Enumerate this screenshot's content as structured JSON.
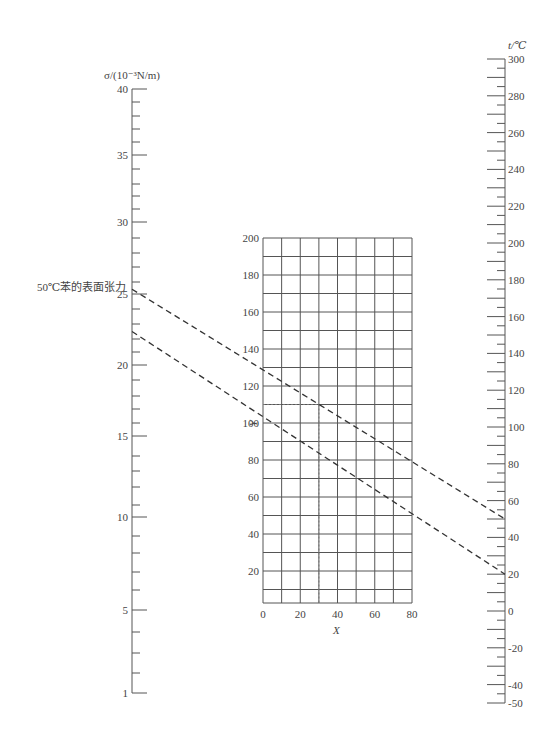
{
  "chart_data": {
    "type": "nomograph",
    "title": "50℃苯的表面张力",
    "annotation": "50℃苯的表面张力",
    "left_axis": {
      "label": "σ/(10⁻³N/m)",
      "major_ticks": [
        40,
        35,
        30,
        25,
        20,
        15,
        10,
        5,
        1
      ],
      "ticks": [
        {
          "v": 40,
          "y": 89
        },
        {
          "v": 39,
          "y": 102
        },
        {
          "v": 38,
          "y": 116
        },
        {
          "v": 37,
          "y": 129
        },
        {
          "v": 36,
          "y": 142
        },
        {
          "v": 35,
          "y": 155
        },
        {
          "v": 34,
          "y": 169
        },
        {
          "v": 33,
          "y": 184
        },
        {
          "v": 32,
          "y": 196
        },
        {
          "v": 31,
          "y": 209
        },
        {
          "v": 30,
          "y": 222
        },
        {
          "v": 29,
          "y": 238
        },
        {
          "v": 28,
          "y": 253
        },
        {
          "v": 27,
          "y": 267
        },
        {
          "v": 26,
          "y": 282
        },
        {
          "v": 25,
          "y": 294
        },
        {
          "v": 24,
          "y": 309
        },
        {
          "v": 23,
          "y": 324
        },
        {
          "v": 22,
          "y": 339
        },
        {
          "v": 21,
          "y": 352
        },
        {
          "v": 20,
          "y": 365
        },
        {
          "v": 19,
          "y": 380
        },
        {
          "v": 18,
          "y": 396
        },
        {
          "v": 17,
          "y": 409
        },
        {
          "v": 16,
          "y": 423
        },
        {
          "v": 15,
          "y": 436
        },
        {
          "v": 14,
          "y": 456
        },
        {
          "v": 13,
          "y": 471
        },
        {
          "v": 12,
          "y": 487
        },
        {
          "v": 11,
          "y": 505
        },
        {
          "v": 10,
          "y": 517
        },
        {
          "v": 9,
          "y": 536
        },
        {
          "v": 8,
          "y": 553
        },
        {
          "v": 7,
          "y": 572
        },
        {
          "v": 6,
          "y": 590
        },
        {
          "v": 5,
          "y": 610
        },
        {
          "v": 4,
          "y": 632
        },
        {
          "v": 3,
          "y": 653
        },
        {
          "v": 2,
          "y": 673
        },
        {
          "v": 1,
          "y": 693
        }
      ]
    },
    "right_axis": {
      "label": "t/℃",
      "range": [
        -50,
        300
      ],
      "major_ticks": [
        300,
        280,
        260,
        240,
        220,
        200,
        180,
        160,
        140,
        120,
        100,
        80,
        60,
        40,
        20,
        0,
        -20,
        -40,
        -50
      ],
      "minor_step": 5
    },
    "grid": {
      "xlabel": "X",
      "ylabel": "Y",
      "x_ticks": [
        0,
        20,
        40,
        60,
        80
      ],
      "y_ticks": [
        20,
        40,
        60,
        80,
        100,
        120,
        140,
        160,
        180,
        200
      ],
      "xlim": [
        0,
        80
      ],
      "ylim": [
        3,
        200
      ],
      "x_step": 10,
      "y_step": 10
    },
    "guide_point": {
      "X": 30,
      "Y": 110,
      "style": "dotted"
    },
    "lines": [
      {
        "name": "upper dashed line",
        "from": {
          "sigma": 25.4
        },
        "to": {
          "t": 50
        },
        "through_grid": {
          "X": 0,
          "Y": 131
        }
      },
      {
        "name": "lower dashed line",
        "from": {
          "sigma": 22.5
        },
        "to": {
          "t": 20
        },
        "through_grid": {
          "X": 30,
          "Y": 85
        }
      }
    ]
  },
  "labels": {
    "left_axis_title": "σ/(10⁻³N/m)",
    "right_axis_title": "t/℃",
    "annotation": "50℃苯的表面张力",
    "grid_x_title": "X",
    "grid_y_title": "Y"
  }
}
